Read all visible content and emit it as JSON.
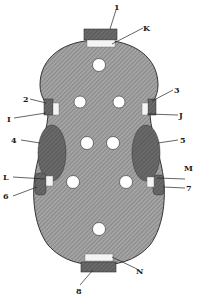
{
  "figure": {
    "colors": {
      "plate": "#9a9a9a",
      "hatch": "#6e6e6e",
      "block": "#5a5a5a",
      "pad": "#f4f4f4",
      "hole": "#ffffff",
      "line": "#222222"
    },
    "labels": {
      "n1": "1",
      "k": "K",
      "n2": "2",
      "i": "I",
      "n3": "3",
      "j": "J",
      "n4": "4",
      "n5": "5",
      "l": "L",
      "m": "M",
      "n6": "6",
      "n7": "7",
      "n": "N",
      "n8": "8"
    }
  }
}
